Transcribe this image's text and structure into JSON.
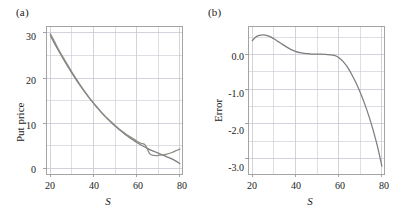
{
  "figure": {
    "width": 396,
    "height": 220,
    "background": "#ffffff",
    "curve_color": "#808080",
    "curve_color_secondary": "#8a8a82",
    "grid_color": "#c8c8d2",
    "frame_color": "#9a9a9a",
    "text_color": "#1a1a1a"
  },
  "panels": [
    {
      "id": "a",
      "label": "(a)",
      "ylabel": "Put price",
      "xlabel": "S",
      "xticks": [
        "20",
        "40",
        "60",
        "80"
      ],
      "yticks": [
        "0",
        "10",
        "20",
        "30"
      ]
    },
    {
      "id": "b",
      "label": "(b)",
      "ylabel": "Error",
      "xlabel": "S",
      "xticks": [
        "20",
        "40",
        "60",
        "80"
      ],
      "yticks": [
        "0.0",
        "-1.0",
        "-2.0",
        "-3.0"
      ]
    }
  ],
  "chart_data": [
    {
      "type": "line",
      "panel": "a",
      "title": "(a)",
      "xlabel": "S",
      "ylabel": "Put price",
      "xlim": [
        18,
        81
      ],
      "ylim": [
        -1.2,
        31.5
      ],
      "xticks": [
        20,
        40,
        60,
        80
      ],
      "yticks": [
        0,
        10,
        20,
        30
      ],
      "xminor": [
        30,
        50,
        70
      ],
      "yminor": [
        5,
        15,
        25
      ],
      "grid": true,
      "legend": "none",
      "series": [
        {
          "name": "Exact put price",
          "color": "#7d7d7d",
          "x": [
            20,
            22,
            24,
            26,
            28,
            30,
            32,
            34,
            36,
            38,
            40,
            42,
            44,
            46,
            48,
            50,
            52,
            54,
            56,
            58,
            60,
            62,
            64,
            66,
            68,
            70,
            72,
            74,
            76,
            78,
            80
          ],
          "y": [
            29.4,
            27.6,
            25.9,
            24.2,
            22.6,
            21.1,
            19.6,
            18.2,
            16.9,
            15.6,
            14.4,
            13.3,
            12.2,
            11.2,
            10.3,
            9.4,
            8.6,
            7.8,
            7.1,
            6.4,
            5.8,
            5.2,
            4.7,
            4.2,
            3.8,
            3.4,
            3.0,
            2.6,
            2.2,
            1.7,
            1.1
          ]
        },
        {
          "name": "Approximate put price",
          "color": "#8c8c84",
          "x": [
            20,
            22,
            24,
            26,
            28,
            30,
            32,
            34,
            36,
            38,
            40,
            42,
            44,
            46,
            48,
            50,
            52,
            54,
            56,
            58,
            60,
            62,
            64,
            66,
            68,
            70,
            72,
            74,
            76,
            78,
            80
          ],
          "y": [
            29.8,
            28.0,
            26.2,
            24.5,
            22.9,
            21.3,
            19.8,
            18.4,
            17.0,
            15.7,
            14.5,
            13.4,
            12.3,
            11.3,
            10.4,
            9.5,
            8.7,
            8.0,
            7.3,
            6.7,
            6.1,
            5.6,
            5.2,
            3.3,
            2.9,
            2.9,
            3.0,
            3.2,
            3.5,
            3.9,
            4.3
          ]
        }
      ]
    },
    {
      "type": "line",
      "panel": "b",
      "title": "(b)",
      "xlabel": "S",
      "ylabel": "Error",
      "xlim": [
        18,
        81
      ],
      "ylim": [
        -3.45,
        0.82
      ],
      "xticks": [
        20,
        40,
        60,
        80
      ],
      "yticks": [
        0.0,
        -1.0,
        -2.0,
        -3.0
      ],
      "xminor": [
        30,
        50,
        70
      ],
      "yminor": [
        0.5,
        -0.5,
        -1.5,
        -2.5
      ],
      "grid": true,
      "legend": "none",
      "series": [
        {
          "name": "Error",
          "color": "#7d7d7d",
          "x": [
            20,
            22,
            24,
            26,
            28,
            30,
            32,
            34,
            36,
            38,
            40,
            42,
            44,
            46,
            48,
            50,
            52,
            54,
            56,
            58,
            60,
            62,
            64,
            66,
            68,
            70,
            72,
            74,
            76,
            78,
            80
          ],
          "y": [
            0.4,
            0.52,
            0.56,
            0.56,
            0.52,
            0.45,
            0.37,
            0.29,
            0.21,
            0.14,
            0.09,
            0.05,
            0.03,
            0.02,
            0.01,
            0.01,
            0.01,
            0.0,
            -0.01,
            -0.03,
            -0.09,
            -0.2,
            -0.36,
            -0.57,
            -0.82,
            -1.1,
            -1.42,
            -1.78,
            -2.19,
            -2.66,
            -3.22
          ]
        }
      ]
    }
  ]
}
